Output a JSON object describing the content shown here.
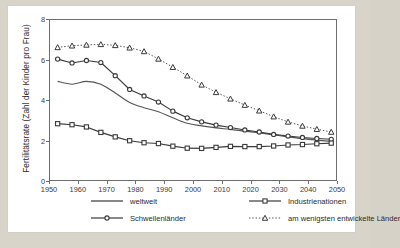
{
  "chart_data": {
    "type": "line",
    "title": "",
    "subtitle": "",
    "xlabel": "",
    "ylabel": "Fertilitätsrate (Zahl der Kinder pro Frau)",
    "xlim": [
      1950,
      2050
    ],
    "ylim": [
      0,
      8
    ],
    "xticks": [
      1950,
      1960,
      1970,
      1980,
      1990,
      2000,
      2010,
      2020,
      2030,
      2040,
      2050
    ],
    "yticks": [
      0,
      2,
      4,
      6,
      8
    ],
    "grid": false,
    "legend_position": "bottom",
    "x": [
      1953,
      1958,
      1963,
      1968,
      1973,
      1978,
      1983,
      1988,
      1993,
      1998,
      2003,
      2008,
      2013,
      2018,
      2023,
      2028,
      2033,
      2038,
      2043,
      2048
    ],
    "series": [
      {
        "name": "weltweit",
        "marker": "none",
        "linestyle": "solid",
        "color": "#555555",
        "values": [
          4.92,
          4.78,
          4.92,
          4.78,
          4.35,
          3.88,
          3.62,
          3.42,
          3.12,
          2.85,
          2.72,
          2.62,
          2.55,
          2.46,
          2.38,
          2.28,
          2.18,
          2.09,
          2.02,
          1.96
        ]
      },
      {
        "name": "Schwellenländer",
        "marker": "circle",
        "linestyle": "solid",
        "color": "#3a3a3a",
        "values": [
          6.02,
          5.83,
          5.95,
          5.85,
          5.2,
          4.52,
          4.2,
          3.9,
          3.45,
          3.12,
          2.92,
          2.76,
          2.64,
          2.52,
          2.42,
          2.3,
          2.22,
          2.15,
          2.1,
          2.06
        ]
      },
      {
        "name": "Industrienationen",
        "marker": "square",
        "linestyle": "solid",
        "color": "#3a3a3a",
        "values": [
          2.83,
          2.78,
          2.67,
          2.4,
          2.18,
          1.99,
          1.89,
          1.85,
          1.72,
          1.62,
          1.61,
          1.66,
          1.71,
          1.7,
          1.7,
          1.73,
          1.78,
          1.8,
          1.84,
          1.87
        ]
      },
      {
        "name": "am wenigsten entwickelte Länder",
        "marker": "triangle",
        "linestyle": "dotted",
        "color": "#3a3a3a",
        "values": [
          6.6,
          6.68,
          6.72,
          6.75,
          6.7,
          6.58,
          6.4,
          6.03,
          5.62,
          5.2,
          4.75,
          4.38,
          4.06,
          3.75,
          3.47,
          3.18,
          2.92,
          2.72,
          2.56,
          2.42
        ]
      }
    ]
  },
  "legend": {
    "items": [
      {
        "label": "weltweit",
        "marker": "none",
        "linestyle": "solid"
      },
      {
        "label": "Industrienationen",
        "marker": "square",
        "linestyle": "solid"
      },
      {
        "label": "Schwellenländer",
        "marker": "circle",
        "linestyle": "solid"
      },
      {
        "label": "am wenigsten entwickelte Länder",
        "marker": "triangle",
        "linestyle": "dotted"
      }
    ]
  },
  "colors": {
    "page_background": "#d9d4ca",
    "card_background": "#ffffff",
    "axis": "#6e6e6e",
    "text": "#2b2b2b",
    "line_primary": "#3a3a3a",
    "line_secondary": "#555555"
  }
}
